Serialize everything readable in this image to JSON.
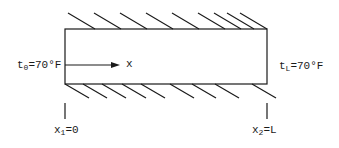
{
  "diagram": {
    "type": "insulated rod / slab with fixed ends",
    "stroke_color": "#1a1a1a",
    "labels": {
      "left_temp": {
        "base": "t",
        "sub": "0",
        "rest": "=70°F"
      },
      "right_temp": {
        "base": "t",
        "sub": "L",
        "rest": "=70°F"
      },
      "axis": "x",
      "left_position": {
        "base": "x",
        "sub": "1",
        "rest": "=0"
      },
      "right_position": {
        "base": "x",
        "sub": "2",
        "rest": "=L"
      }
    },
    "hatching": {
      "top_count": 9,
      "bottom_count": 9
    }
  }
}
